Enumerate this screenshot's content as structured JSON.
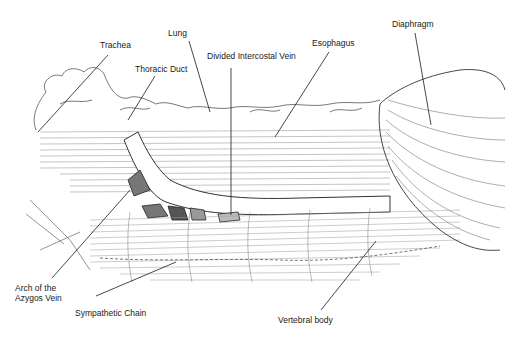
{
  "figure": {
    "background": "#ffffff",
    "ink_color": "#1a1a1a"
  },
  "labels": [
    {
      "id": "trachea",
      "text": "Trachea",
      "x": 100,
      "y": 40,
      "line": [
        108,
        55,
        38,
        132
      ]
    },
    {
      "id": "lung",
      "text": "Lung",
      "x": 168,
      "y": 28,
      "line": [
        189,
        41,
        210,
        112
      ]
    },
    {
      "id": "thoracic-duct",
      "text": "Thoracic Duct",
      "x": 135,
      "y": 64,
      "line": [
        155,
        76,
        128,
        120
      ]
    },
    {
      "id": "divided-intercostal-vein",
      "text": "Divided Intercostal Vein",
      "x": 207,
      "y": 51,
      "line": [
        231,
        68,
        231,
        215
      ]
    },
    {
      "id": "esophagus",
      "text": "Esophagus",
      "x": 312,
      "y": 38,
      "line": [
        329,
        52,
        275,
        137
      ]
    },
    {
      "id": "diaphragm",
      "text": "Diaphragm",
      "x": 392,
      "y": 19,
      "line": [
        415,
        33,
        431,
        125
      ]
    },
    {
      "id": "arch-of-azygos-vein",
      "text": "Arch of the\nAzygos Vein",
      "x": 15,
      "y": 283,
      "line": [
        52,
        278,
        130,
        190
      ]
    },
    {
      "id": "sympathetic-chain",
      "text": "Sympathetic Chain",
      "x": 75,
      "y": 308,
      "line": [
        96,
        296,
        176,
        262
      ]
    },
    {
      "id": "vertebral-body",
      "text": "Vertebral body",
      "x": 278,
      "y": 315,
      "line": [
        321,
        310,
        376,
        241
      ]
    }
  ]
}
